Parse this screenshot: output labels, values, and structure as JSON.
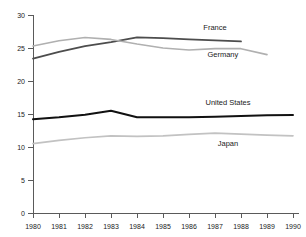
{
  "chart_data": {
    "type": "line",
    "title": "",
    "xlabel": "",
    "ylabel": "",
    "x": [
      1980,
      1981,
      1982,
      1983,
      1984,
      1985,
      1986,
      1987,
      1988,
      1989,
      1990
    ],
    "xtick_labels": [
      "1980",
      "1981",
      "1982",
      "1983",
      "1984",
      "1985",
      "1986",
      "1987",
      "1988",
      "1989",
      "1990"
    ],
    "ytick_labels": [
      "0",
      "5",
      "10",
      "15",
      "20",
      "25",
      "30"
    ],
    "yticks": [
      0,
      5,
      10,
      15,
      20,
      25,
      30
    ],
    "ylim": [
      0,
      30
    ],
    "xlim": [
      1980,
      1990
    ],
    "grid": false,
    "legend_position": "inline-labels",
    "series": [
      {
        "name": "France",
        "label": "France",
        "color": "#4d4d4d",
        "width": 1.8,
        "x": [
          1980,
          1981,
          1982,
          1983,
          1984,
          1985,
          1986,
          1987,
          1988
        ],
        "values": [
          23.4,
          24.4,
          25.3,
          25.9,
          26.6,
          26.5,
          26.3,
          26.15,
          26.0
        ]
      },
      {
        "name": "Germany",
        "label": "Germany",
        "color": "#b0b0b0",
        "width": 1.6,
        "x": [
          1980,
          1981,
          1982,
          1983,
          1984,
          1985,
          1986,
          1987,
          1988,
          1989
        ],
        "values": [
          25.3,
          26.1,
          26.6,
          26.3,
          25.6,
          25.0,
          24.7,
          24.9,
          24.9,
          24.0
        ]
      },
      {
        "name": "United States",
        "label": "United States",
        "color": "#111111",
        "width": 2.0,
        "x": [
          1980,
          1981,
          1982,
          1983,
          1984,
          1985,
          1986,
          1987,
          1988,
          1989,
          1990
        ],
        "values": [
          14.2,
          14.5,
          14.9,
          15.5,
          14.5,
          14.5,
          14.5,
          14.6,
          14.7,
          14.8,
          14.85
        ]
      },
      {
        "name": "Japan",
        "label": "Japan",
        "color": "#c2c2c2",
        "width": 1.7,
        "x": [
          1980,
          1981,
          1982,
          1983,
          1984,
          1985,
          1986,
          1987,
          1988,
          1989,
          1990
        ],
        "values": [
          10.5,
          11.0,
          11.4,
          11.7,
          11.6,
          11.7,
          11.9,
          12.1,
          11.95,
          11.8,
          11.7
        ]
      }
    ],
    "series_label_positions": [
      {
        "name": "France",
        "x": 1987.0,
        "y": 27.8
      },
      {
        "name": "Germany",
        "x": 1987.3,
        "y": 23.6
      },
      {
        "name": "United States",
        "x": 1987.5,
        "y": 16.3
      },
      {
        "name": "Japan",
        "x": 1987.5,
        "y": 10.2
      }
    ]
  },
  "axes": {
    "y_axis_name": "value-axis",
    "x_axis_name": "year-axis"
  }
}
